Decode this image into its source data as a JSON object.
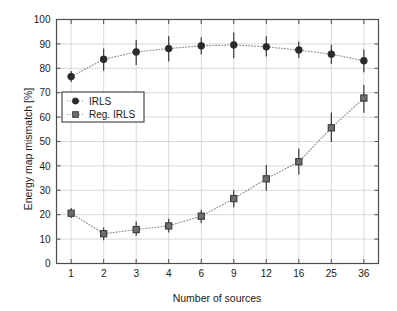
{
  "chart_data": {
    "type": "line",
    "title": "",
    "xlabel": "Number of sources",
    "ylabel": "Energy map mismatch [%]",
    "x_tick_labels": [
      "1",
      "2",
      "3",
      "4",
      "6",
      "9",
      "12",
      "16",
      "25",
      "36"
    ],
    "x_positions": [
      1,
      2,
      3,
      4,
      5,
      6,
      7,
      8,
      9,
      10
    ],
    "xlim": [
      0.55,
      10.45
    ],
    "ylim": [
      0,
      100
    ],
    "y_ticks": [
      0,
      10,
      20,
      30,
      40,
      50,
      60,
      70,
      80,
      90,
      100
    ],
    "y_tick_labels": [
      "0",
      "10",
      "20",
      "30",
      "40",
      "50",
      "60",
      "70",
      "80",
      "90",
      "100"
    ],
    "grid": true,
    "legend_position": "upper-left-inside",
    "line_style": "dotted",
    "series": [
      {
        "name": "IRLS",
        "marker": "circle",
        "color": "#2b2b2b",
        "values": [
          76.6,
          83.7,
          86.7,
          88.1,
          89.2,
          89.6,
          88.8,
          87.5,
          85.8,
          83.1
        ],
        "err_low": [
          2.2,
          4.7,
          5.3,
          5.3,
          3.5,
          5.5,
          4.0,
          3.3,
          4.0,
          4.7
        ],
        "err_high": [
          2.3,
          4.4,
          4.9,
          5.0,
          3.4,
          5.1,
          4.3,
          3.5,
          3.9,
          4.6
        ]
      },
      {
        "name": "Reg. IRLS",
        "marker": "square",
        "color": "#4a4a4a",
        "values": [
          20.6,
          12.2,
          13.9,
          15.4,
          19.4,
          26.6,
          34.7,
          41.7,
          55.6,
          67.8
        ],
        "err_low": [
          2.0,
          2.7,
          2.5,
          2.7,
          2.9,
          3.6,
          4.9,
          5.2,
          5.8,
          6.0
        ],
        "err_high": [
          2.1,
          2.6,
          3.3,
          2.9,
          2.6,
          3.4,
          5.7,
          5.4,
          6.3,
          5.4
        ]
      }
    ]
  },
  "legend": {
    "items": [
      {
        "label": "IRLS",
        "marker": "circle"
      },
      {
        "label": "Reg. IRLS",
        "marker": "square"
      }
    ]
  },
  "colors": {
    "axis": "#4d4d4d",
    "grid": "#c8c8c8",
    "text": "#1a1a1a",
    "marker": "#2b2b2b",
    "line": "#8c8c8c"
  }
}
